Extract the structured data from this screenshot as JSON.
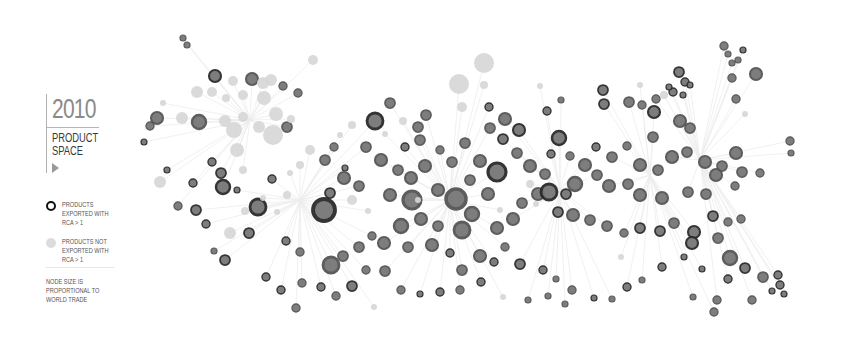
{
  "legend": {
    "year": "2010",
    "title_line1": "PRODUCT",
    "title_line2": "SPACE",
    "play_icon": "play-triangle-icon",
    "items": [
      {
        "symbol": "dark-ring-node",
        "label": "PRODUCTS EXPORTED WITH RCA > 1"
      },
      {
        "symbol": "light-gray-node",
        "label": "PRODUCTS NOT EXPORTED WITH RCA > 1"
      }
    ],
    "note": "NODE SIZE IS PROPORTIONAL TO WORLD TRADE"
  },
  "colors": {
    "background": "#ffffff",
    "edge": "#ececec",
    "rca_dark": "#2a2a2a",
    "rca_mid": "#555555",
    "rca_light": "#777777",
    "no_rca": "#d6d6d6"
  },
  "graph": {
    "hubs": [
      [
        300,
        200
      ],
      [
        450,
        200
      ],
      [
        560,
        190
      ],
      [
        650,
        175
      ],
      [
        250,
        120
      ],
      [
        700,
        160
      ]
    ],
    "nodes": [
      [
        183,
        38,
        3,
        "m"
      ],
      [
        187,
        45,
        3,
        "m"
      ],
      [
        163,
        103,
        3,
        "n"
      ],
      [
        150,
        126,
        4,
        "m"
      ],
      [
        144,
        142,
        3,
        "d"
      ],
      [
        157,
        118,
        6,
        "m"
      ],
      [
        160,
        182,
        6,
        "n"
      ],
      [
        167,
        170,
        3,
        "d"
      ],
      [
        197,
        92,
        6,
        "n"
      ],
      [
        215,
        76,
        6,
        "d"
      ],
      [
        233,
        81,
        5,
        "n"
      ],
      [
        252,
        79,
        6,
        "m"
      ],
      [
        263,
        83,
        6,
        "n"
      ],
      [
        271,
        80,
        6,
        "n"
      ],
      [
        283,
        86,
        4,
        "m"
      ],
      [
        243,
        95,
        5,
        "n"
      ],
      [
        264,
        98,
        7,
        "n"
      ],
      [
        276,
        114,
        7,
        "n"
      ],
      [
        298,
        93,
        4,
        "m"
      ],
      [
        226,
        98,
        4,
        "n"
      ],
      [
        243,
        117,
        5,
        "n"
      ],
      [
        259,
        127,
        6,
        "n"
      ],
      [
        287,
        127,
        5,
        "m"
      ],
      [
        291,
        119,
        4,
        "n"
      ],
      [
        234,
        130,
        8,
        "n"
      ],
      [
        225,
        121,
        6,
        "n"
      ],
      [
        273,
        135,
        10,
        "n"
      ],
      [
        237,
        150,
        7,
        "n"
      ],
      [
        199,
        122,
        7,
        "m"
      ],
      [
        212,
        92,
        5,
        "n"
      ],
      [
        313,
        60,
        5,
        "n"
      ],
      [
        182,
        118,
        6,
        "n"
      ],
      [
        223,
        187,
        7,
        "d"
      ],
      [
        245,
        211,
        4,
        "n"
      ],
      [
        196,
        210,
        5,
        "d"
      ],
      [
        193,
        183,
        4,
        "d"
      ],
      [
        212,
        162,
        4,
        "d"
      ],
      [
        221,
        173,
        5,
        "d"
      ],
      [
        243,
        170,
        4,
        "n"
      ],
      [
        258,
        207,
        8,
        "d"
      ],
      [
        272,
        179,
        4,
        "d"
      ],
      [
        249,
        233,
        5,
        "d"
      ],
      [
        214,
        251,
        3,
        "m"
      ],
      [
        178,
        206,
        4,
        "m"
      ],
      [
        206,
        224,
        4,
        "d"
      ],
      [
        230,
        233,
        6,
        "n"
      ],
      [
        237,
        190,
        3,
        "d"
      ],
      [
        225,
        260,
        5,
        "d"
      ],
      [
        324,
        210,
        11,
        "d"
      ],
      [
        368,
        211,
        3,
        "n"
      ],
      [
        330,
        193,
        5,
        "d"
      ],
      [
        352,
        200,
        5,
        "n"
      ],
      [
        345,
        168,
        3,
        "d"
      ],
      [
        375,
        121,
        8,
        "d"
      ],
      [
        390,
        103,
        5,
        "m"
      ],
      [
        403,
        121,
        4,
        "n"
      ],
      [
        418,
        127,
        5,
        "m"
      ],
      [
        426,
        115,
        5,
        "m"
      ],
      [
        459,
        84,
        10,
        "n"
      ],
      [
        462,
        107,
        5,
        "n"
      ],
      [
        489,
        107,
        4,
        "d"
      ],
      [
        490,
        128,
        5,
        "m"
      ],
      [
        505,
        119,
        6,
        "m"
      ],
      [
        503,
        139,
        5,
        "d"
      ],
      [
        519,
        130,
        6,
        "d"
      ],
      [
        517,
        153,
        5,
        "m"
      ],
      [
        547,
        111,
        4,
        "d"
      ],
      [
        559,
        138,
        7,
        "d"
      ],
      [
        530,
        166,
        6,
        "m"
      ],
      [
        497,
        172,
        9,
        "d"
      ],
      [
        480,
        161,
        6,
        "m"
      ],
      [
        465,
        143,
        5,
        "m"
      ],
      [
        411,
        178,
        6,
        "m"
      ],
      [
        425,
        166,
        6,
        "m"
      ],
      [
        398,
        170,
        5,
        "m"
      ],
      [
        381,
        160,
        6,
        "m"
      ],
      [
        366,
        147,
        5,
        "m"
      ],
      [
        344,
        178,
        6,
        "m"
      ],
      [
        359,
        186,
        5,
        "m"
      ],
      [
        390,
        195,
        6,
        "m"
      ],
      [
        412,
        200,
        9,
        "m"
      ],
      [
        438,
        190,
        6,
        "m"
      ],
      [
        456,
        199,
        10,
        "m"
      ],
      [
        472,
        214,
        7,
        "m"
      ],
      [
        462,
        230,
        8,
        "m"
      ],
      [
        438,
        226,
        5,
        "m"
      ],
      [
        421,
        219,
        6,
        "m"
      ],
      [
        401,
        226,
        7,
        "m"
      ],
      [
        384,
        243,
        6,
        "m"
      ],
      [
        408,
        247,
        5,
        "m"
      ],
      [
        432,
        245,
        6,
        "m"
      ],
      [
        450,
        253,
        4,
        "d"
      ],
      [
        462,
        270,
        5,
        "m"
      ],
      [
        480,
        256,
        6,
        "m"
      ],
      [
        497,
        228,
        6,
        "m"
      ],
      [
        513,
        219,
        6,
        "m"
      ],
      [
        522,
        203,
        5,
        "m"
      ],
      [
        538,
        194,
        6,
        "m"
      ],
      [
        549,
        192,
        8,
        "d"
      ],
      [
        566,
        194,
        5,
        "d"
      ],
      [
        575,
        184,
        7,
        "m"
      ],
      [
        585,
        165,
        6,
        "m"
      ],
      [
        597,
        175,
        5,
        "m"
      ],
      [
        609,
        186,
        6,
        "m"
      ],
      [
        628,
        184,
        5,
        "m"
      ],
      [
        640,
        165,
        6,
        "m"
      ],
      [
        658,
        170,
        5,
        "m"
      ],
      [
        672,
        157,
        6,
        "m"
      ],
      [
        687,
        152,
        5,
        "m"
      ],
      [
        705,
        162,
        6,
        "m"
      ],
      [
        722,
        166,
        5,
        "m"
      ],
      [
        736,
        153,
        6,
        "m"
      ],
      [
        640,
        195,
        6,
        "m"
      ],
      [
        662,
        198,
        6,
        "m"
      ],
      [
        688,
        192,
        5,
        "m"
      ],
      [
        706,
        194,
        5,
        "m"
      ],
      [
        716,
        175,
        6,
        "m"
      ],
      [
        742,
        172,
        5,
        "m"
      ],
      [
        760,
        173,
        4,
        "m"
      ],
      [
        735,
        186,
        4,
        "m"
      ],
      [
        603,
        90,
        5,
        "d"
      ],
      [
        604,
        104,
        5,
        "d"
      ],
      [
        629,
        102,
        5,
        "m"
      ],
      [
        642,
        105,
        4,
        "m"
      ],
      [
        656,
        99,
        4,
        "m"
      ],
      [
        664,
        95,
        4,
        "n"
      ],
      [
        640,
        85,
        3,
        "n"
      ],
      [
        654,
        112,
        6,
        "d"
      ],
      [
        673,
        92,
        4,
        "d"
      ],
      [
        679,
        72,
        5,
        "d"
      ],
      [
        685,
        82,
        4,
        "d"
      ],
      [
        669,
        87,
        3,
        "d"
      ],
      [
        683,
        95,
        3,
        "d"
      ],
      [
        690,
        85,
        3,
        "d"
      ],
      [
        724,
        46,
        4,
        "m"
      ],
      [
        728,
        54,
        3,
        "m"
      ],
      [
        732,
        63,
        3,
        "m"
      ],
      [
        738,
        60,
        3,
        "m"
      ],
      [
        743,
        50,
        3,
        "d"
      ],
      [
        732,
        78,
        4,
        "m"
      ],
      [
        756,
        74,
        6,
        "m"
      ],
      [
        736,
        99,
        4,
        "m"
      ],
      [
        745,
        114,
        3,
        "n"
      ],
      [
        790,
        141,
        4,
        "m"
      ],
      [
        791,
        153,
        3,
        "m"
      ],
      [
        653,
        137,
        5,
        "m"
      ],
      [
        680,
        121,
        6,
        "m"
      ],
      [
        690,
        128,
        5,
        "m"
      ],
      [
        612,
        157,
        5,
        "m"
      ],
      [
        627,
        146,
        4,
        "m"
      ],
      [
        596,
        147,
        4,
        "d"
      ],
      [
        551,
        154,
        4,
        "d"
      ],
      [
        570,
        156,
        4,
        "m"
      ],
      [
        545,
        174,
        5,
        "m"
      ],
      [
        530,
        184,
        4,
        "n"
      ],
      [
        500,
        210,
        3,
        "n"
      ],
      [
        558,
        212,
        5,
        "d"
      ],
      [
        573,
        215,
        6,
        "m"
      ],
      [
        590,
        220,
        5,
        "m"
      ],
      [
        607,
        226,
        5,
        "m"
      ],
      [
        624,
        233,
        4,
        "m"
      ],
      [
        640,
        228,
        5,
        "d"
      ],
      [
        660,
        231,
        5,
        "d"
      ],
      [
        674,
        223,
        5,
        "m"
      ],
      [
        694,
        232,
        6,
        "d"
      ],
      [
        692,
        243,
        6,
        "d"
      ],
      [
        713,
        216,
        5,
        "d"
      ],
      [
        728,
        222,
        4,
        "m"
      ],
      [
        741,
        219,
        4,
        "m"
      ],
      [
        718,
        238,
        5,
        "m"
      ],
      [
        730,
        258,
        7,
        "m"
      ],
      [
        745,
        268,
        5,
        "d"
      ],
      [
        763,
        277,
        5,
        "m"
      ],
      [
        778,
        275,
        4,
        "d"
      ],
      [
        780,
        285,
        4,
        "d"
      ],
      [
        772,
        291,
        3,
        "d"
      ],
      [
        752,
        300,
        4,
        "m"
      ],
      [
        717,
        300,
        4,
        "m"
      ],
      [
        728,
        279,
        4,
        "d"
      ],
      [
        702,
        269,
        3,
        "d"
      ],
      [
        684,
        257,
        3,
        "d"
      ],
      [
        662,
        267,
        4,
        "d"
      ],
      [
        642,
        280,
        3,
        "m"
      ],
      [
        627,
        287,
        4,
        "d"
      ],
      [
        612,
        299,
        3,
        "m"
      ],
      [
        594,
        298,
        3,
        "d"
      ],
      [
        572,
        290,
        4,
        "m"
      ],
      [
        556,
        279,
        3,
        "m"
      ],
      [
        543,
        270,
        4,
        "d"
      ],
      [
        520,
        264,
        5,
        "d"
      ],
      [
        505,
        247,
        4,
        "m"
      ],
      [
        494,
        262,
        4,
        "d"
      ],
      [
        481,
        282,
        4,
        "d"
      ],
      [
        460,
        290,
        4,
        "m"
      ],
      [
        440,
        292,
        4,
        "d"
      ],
      [
        420,
        294,
        3,
        "d"
      ],
      [
        401,
        290,
        4,
        "m"
      ],
      [
        385,
        271,
        5,
        "m"
      ],
      [
        366,
        270,
        4,
        "m"
      ],
      [
        352,
        286,
        5,
        "d"
      ],
      [
        336,
        296,
        4,
        "m"
      ],
      [
        321,
        287,
        4,
        "d"
      ],
      [
        302,
        283,
        4,
        "m"
      ],
      [
        281,
        290,
        4,
        "d"
      ],
      [
        266,
        277,
        4,
        "d"
      ],
      [
        331,
        265,
        8,
        "m"
      ],
      [
        343,
        256,
        5,
        "m"
      ],
      [
        359,
        247,
        5,
        "m"
      ],
      [
        372,
        236,
        4,
        "m"
      ],
      [
        286,
        241,
        4,
        "d"
      ],
      [
        300,
        252,
        4,
        "m"
      ],
      [
        296,
        308,
        4,
        "m"
      ],
      [
        374,
        307,
        3,
        "n"
      ],
      [
        503,
        297,
        3,
        "n"
      ],
      [
        528,
        300,
        3,
        "m"
      ],
      [
        548,
        296,
        3,
        "m"
      ],
      [
        565,
        304,
        3,
        "m"
      ],
      [
        693,
        297,
        3,
        "m"
      ],
      [
        714,
        312,
        4,
        "m"
      ],
      [
        784,
        294,
        3,
        "d"
      ],
      [
        310,
        150,
        5,
        "n"
      ],
      [
        325,
        160,
        5,
        "m"
      ],
      [
        334,
        147,
        4,
        "m"
      ],
      [
        300,
        165,
        4,
        "n"
      ],
      [
        290,
        173,
        3,
        "n"
      ],
      [
        287,
        195,
        4,
        "n"
      ],
      [
        277,
        212,
        3,
        "n"
      ],
      [
        263,
        198,
        3,
        "n"
      ],
      [
        484,
        63,
        10,
        "n"
      ],
      [
        484,
        85,
        4,
        "n"
      ],
      [
        540,
        86,
        3,
        "n"
      ],
      [
        561,
        100,
        3,
        "m"
      ],
      [
        418,
        200,
        3,
        "n"
      ],
      [
        536,
        204,
        3,
        "n"
      ],
      [
        621,
        257,
        3,
        "n"
      ],
      [
        440,
        150,
        4,
        "m"
      ],
      [
        452,
        162,
        5,
        "m"
      ],
      [
        470,
        180,
        5,
        "m"
      ],
      [
        488,
        194,
        6,
        "m"
      ],
      [
        420,
        140,
        5,
        "m"
      ],
      [
        405,
        147,
        4,
        "d"
      ],
      [
        385,
        134,
        3,
        "n"
      ],
      [
        352,
        125,
        4,
        "n"
      ],
      [
        340,
        135,
        3,
        "n"
      ]
    ]
  }
}
